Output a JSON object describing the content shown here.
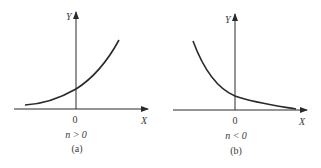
{
  "figure": {
    "panels": [
      {
        "id": "a",
        "caption": "(a)",
        "condition": "n > 0",
        "x_axis_label": "X",
        "y_axis_label": "Y",
        "origin_label": "0",
        "curve": "increasing exponential"
      },
      {
        "id": "b",
        "caption": "(b)",
        "condition": "n < 0",
        "x_axis_label": "X",
        "y_axis_label": "Y",
        "origin_label": "0",
        "curve": "decreasing exponential"
      }
    ],
    "colors": {
      "stroke": "#2a2a2a",
      "background": "#ffffff"
    }
  }
}
